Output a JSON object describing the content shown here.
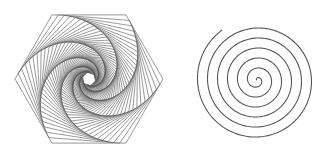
{
  "figures": [
    {
      "name": "hexagonal-whirl",
      "type": "nested-rotated-hexagons",
      "center": [
        89,
        79
      ],
      "outer_radius": 74,
      "sides": 6,
      "start_angle_deg": 0,
      "iterations": 60,
      "interpolation": 0.085,
      "stroke": "#555555",
      "stroke_width": 0.6
    },
    {
      "name": "archimedean-spiral",
      "type": "archimedean-spiral",
      "center": [
        257,
        80
      ],
      "turns": 6.1,
      "max_radius": 61,
      "start_angle_deg": 235,
      "direction": "clockwise-outward",
      "stroke": "#555555",
      "stroke_width": 1.1
    }
  ],
  "colors": {
    "background": "#ffffff",
    "line": "#555555"
  }
}
